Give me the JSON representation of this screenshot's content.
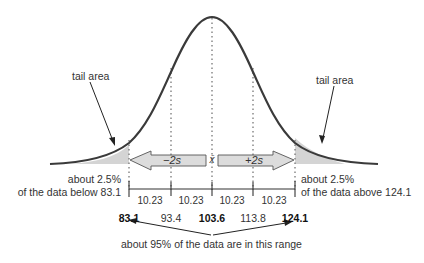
{
  "diagram": {
    "title": "",
    "annotations": {
      "left_tail_label": "tail area",
      "right_tail_label": "tail area",
      "left_tail_text_line1": "about 2.5%",
      "left_tail_text_line2": "of the data below 83.1",
      "right_tail_text_line1": "about 2.5%",
      "right_tail_text_line2": "of the data above 124.1",
      "range_text": "about 95% of the data are in this range"
    },
    "arrows": {
      "left": "−2s",
      "right": "+2s",
      "center": "x̄"
    },
    "segments": [
      "10.23",
      "10.23",
      "10.23",
      "10.23"
    ],
    "axis_values": [
      {
        "value": "83.1",
        "bold": true
      },
      {
        "value": "93.4",
        "bold": false
      },
      {
        "value": "103.6",
        "bold": true
      },
      {
        "value": "113.8",
        "bold": false
      },
      {
        "value": "124.1",
        "bold": true
      }
    ],
    "colors": {
      "curve": "#3a3a3a",
      "tail_fill": "#d4d4d4",
      "arrow_fill": "#dcdcdc",
      "arrow_stroke": "#555555",
      "dotted": "#777777"
    }
  }
}
